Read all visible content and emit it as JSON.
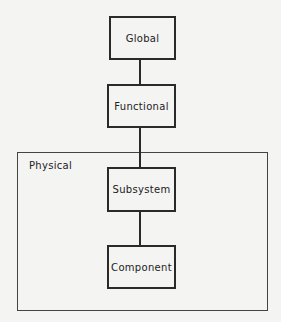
{
  "diagram": {
    "nodes": [
      {
        "id": "global",
        "label": "Global"
      },
      {
        "id": "functional",
        "label": "Functional"
      },
      {
        "id": "subsystem",
        "label": "Subsystem"
      },
      {
        "id": "component",
        "label": "Component"
      }
    ],
    "edges": [
      {
        "from": "global",
        "to": "functional"
      },
      {
        "from": "functional",
        "to": "subsystem"
      },
      {
        "from": "subsystem",
        "to": "component"
      }
    ],
    "group": {
      "label": "Physical",
      "contains": [
        "subsystem",
        "component"
      ]
    }
  }
}
